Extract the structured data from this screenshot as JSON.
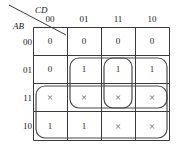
{
  "kmap": {
    "variable_labels": {
      "columns": "CD",
      "rows": "AB"
    },
    "column_headers": [
      "00",
      "01",
      "11",
      "10"
    ],
    "row_headers": [
      "00",
      "01",
      "11",
      "10"
    ],
    "cells": [
      [
        "0",
        "0",
        "0",
        "0"
      ],
      [
        "0",
        "1",
        "1",
        "1"
      ],
      [
        "×",
        "×",
        "×",
        "×"
      ],
      [
        "1",
        "1",
        "×",
        "×"
      ]
    ],
    "groups": [
      {
        "name": "group-rows-01-11-cols-01-11-10",
        "rows": [
          1,
          2
        ],
        "cols": [
          1,
          2,
          3
        ],
        "cell_count": 6
      },
      {
        "name": "group-rows-01-11-col-11",
        "rows": [
          1,
          2
        ],
        "cols": [
          2
        ],
        "cell_count": 2
      },
      {
        "name": "group-rows-11-10-all-cols",
        "rows": [
          2,
          3
        ],
        "cols": [
          0,
          1,
          2,
          3
        ],
        "cell_count": 8
      }
    ],
    "colors": {
      "grid_line": "#3a3a3a",
      "loop_line": "#4a4a4a",
      "text": "#1a1a1a",
      "background": "#ffffff"
    }
  }
}
